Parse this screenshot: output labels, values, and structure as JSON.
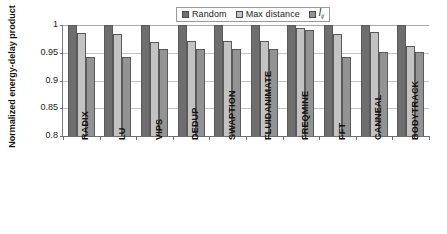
{
  "chart_data": {
    "type": "bar",
    "title": "",
    "xlabel": "",
    "ylabel": "Normalized energy-delay product",
    "ylim": [
      0.8,
      1.0
    ],
    "yticks": [
      "0.8",
      "0.85",
      "0.9",
      "0.95",
      "1"
    ],
    "ytick_values": [
      0.8,
      0.85,
      0.9,
      0.95,
      1.0
    ],
    "grid": true,
    "legend_position": "top-center",
    "categories": [
      "RADIX",
      "LU",
      "VIPS",
      "DEDUP",
      "SWAPTION",
      "FLUIDANIMATE",
      "FREQMINE",
      "FFT",
      "CANNEAL",
      "BODYTRACK"
    ],
    "series": [
      {
        "name": "Random",
        "color": "#6e6e6e",
        "values": [
          1.0,
          1.0,
          1.0,
          1.0,
          1.0,
          1.0,
          1.0,
          1.0,
          1.0,
          1.0
        ]
      },
      {
        "name": "Max distance",
        "color": "#c3c3c3",
        "values": [
          0.985,
          0.984,
          0.97,
          0.971,
          0.971,
          0.971,
          0.995,
          0.983,
          0.988,
          0.963
        ]
      },
      {
        "name": "l_ij",
        "color": "#939393",
        "values": [
          0.943,
          0.943,
          0.956,
          0.957,
          0.957,
          0.957,
          0.991,
          0.942,
          0.952,
          0.952
        ]
      }
    ]
  },
  "legend": {
    "entries": [
      {
        "label": "Random"
      },
      {
        "label": "Max distance"
      },
      {
        "label": "l",
        "subscript": "ij"
      }
    ]
  },
  "axis": {
    "y_title": "Normalized energy-delay product"
  },
  "colors": {
    "series_random": "#6e6e6e",
    "series_max_distance": "#c3c3c3",
    "series_lij": "#939393",
    "gridline": "#c4c4c4",
    "axis": "#6f6f6f"
  }
}
